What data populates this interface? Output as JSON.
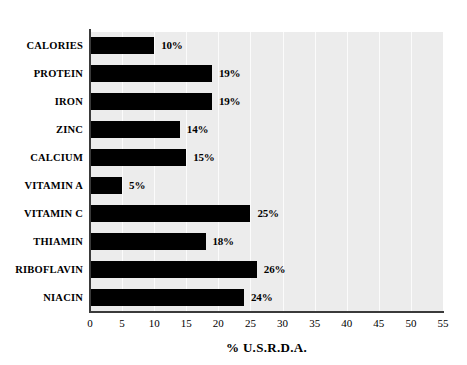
{
  "chart_data": {
    "type": "bar",
    "orientation": "horizontal",
    "title": "",
    "subtitle": "",
    "xlabel": "% U.S.R.D.A.",
    "ylabel": "",
    "xlim": [
      0,
      55
    ],
    "xticks": [
      "0",
      "5",
      "10",
      "15",
      "20",
      "25",
      "30",
      "35",
      "40",
      "45",
      "50",
      "55"
    ],
    "grid": true,
    "grid_axis": "x",
    "legend": null,
    "categories": [
      "CALORIES",
      "PROTEIN",
      "IRON",
      "ZINC",
      "CALCIUM",
      "VITAMIN A",
      "VITAMIN C",
      "THIAMIN",
      "RIBOFLAVIN",
      "NIACIN"
    ],
    "values": [
      10,
      19,
      19,
      14,
      15,
      5,
      25,
      18,
      26,
      24
    ],
    "data_labels": [
      "10%",
      "19%",
      "19%",
      "14%",
      "15%",
      "5%",
      "25%",
      "18%",
      "26%",
      "24%"
    ]
  },
  "style": {
    "bar_color": "#000000",
    "plot_background": "#ececec",
    "page_background": "#ffffff",
    "axis_color": "#3a3a3a",
    "gridline_color": "#fbfbfb",
    "text_color": "#000000"
  }
}
